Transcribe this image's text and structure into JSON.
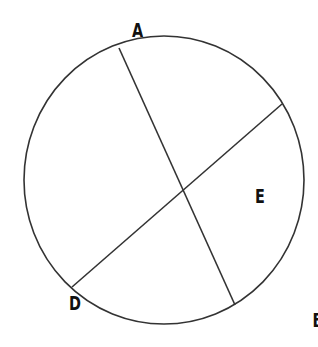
{
  "diagram": {
    "type": "circle-with-chords",
    "colors": {
      "stroke": "#333333",
      "label": "#111111",
      "background": "#ffffff"
    },
    "circle": {
      "cx": 164,
      "cy": 180,
      "rx": 140,
      "ry": 144
    },
    "points": {
      "A": {
        "label": "A",
        "x": 119,
        "y": 48
      },
      "B": {
        "label": "B",
        "x": 235,
        "y": 305
      },
      "C": {
        "label": "C",
        "x": 282,
        "y": 104
      },
      "D": {
        "label": "D",
        "x": 72,
        "y": 287
      },
      "E": {
        "label": "E",
        "x": 183,
        "y": 190
      }
    },
    "segments": [
      {
        "name": "AB",
        "from": "A",
        "to": "B"
      },
      {
        "name": "CD",
        "from": "C",
        "to": "D"
      }
    ],
    "labels": [
      {
        "text": "A",
        "x": 107.5,
        "y": 37
      },
      {
        "text": "C",
        "x": 295.5,
        "y": 98
      },
      {
        "text": "E",
        "x": 203,
        "y": 203
      },
      {
        "text": "D",
        "x": 58.5,
        "y": 310
      },
      {
        "text": "B",
        "x": 248.5,
        "y": 327
      }
    ]
  }
}
